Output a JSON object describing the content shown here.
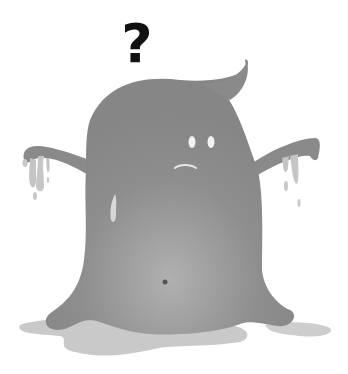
{
  "illustration": {
    "subject": "confused grey blob ghost character",
    "symbol": "?",
    "colors": {
      "background": "#ffffff",
      "body": "#8c8c8c",
      "body_light": "#a8a8a8",
      "drips": "#c4c4c4",
      "shadow": "#c8c8c8",
      "eyes": "#f2f2f2",
      "navel": "#555555",
      "question_mark": "#111111"
    }
  }
}
